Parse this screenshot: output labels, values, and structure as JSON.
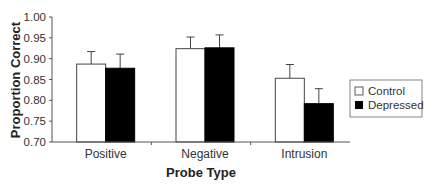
{
  "chart_data": {
    "type": "bar",
    "title": "",
    "xlabel": "Probe Type",
    "ylabel": "Proportion Correct",
    "ylim": [
      0.7,
      1.0
    ],
    "yticks": [
      "0.70",
      "0.75",
      "0.80",
      "0.85",
      "0.90",
      "0.95",
      "1.00"
    ],
    "categories": [
      "Positive",
      "Negative",
      "Intrusion"
    ],
    "series": [
      {
        "name": "Control",
        "color": "#ffffff",
        "values": [
          0.887,
          0.924,
          0.853
        ],
        "error_upper": [
          0.917,
          0.952,
          0.886
        ]
      },
      {
        "name": "Depressed",
        "color": "#000000",
        "values": [
          0.877,
          0.926,
          0.792
        ],
        "error_upper": [
          0.911,
          0.957,
          0.828
        ]
      }
    ],
    "grid": false,
    "legend_position": "right"
  },
  "axis": {
    "y_title": "Proportion Correct",
    "x_title": "Probe Type"
  },
  "legend": {
    "items": [
      {
        "label": "Control"
      },
      {
        "label": "Depressed"
      }
    ]
  }
}
